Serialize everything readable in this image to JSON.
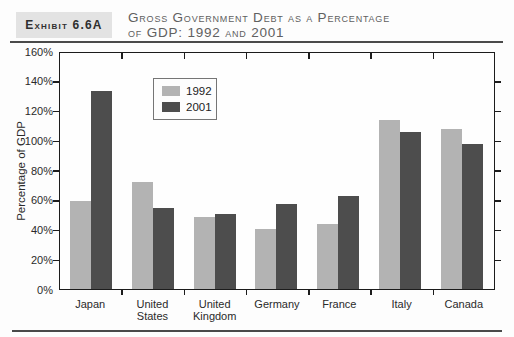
{
  "header": {
    "exhibit_label": "Exhibit 6.6A",
    "title_line1": "Gross Government Debt as a Percentage",
    "title_line2": "of GDP: 1992 and 2001"
  },
  "chart_data": {
    "type": "bar",
    "title": "Gross Government Debt as a Percentage of GDP: 1992 and 2001",
    "categories": [
      "Japan",
      "United States",
      "United Kingdom",
      "Germany",
      "France",
      "Italy",
      "Canada"
    ],
    "series": [
      {
        "name": "1992",
        "color": "#b3b3b3",
        "values": [
          60,
          73,
          49,
          41,
          44,
          115,
          109
        ]
      },
      {
        "name": "2001",
        "color": "#4d4d4d",
        "values": [
          135,
          55,
          51,
          58,
          63,
          107,
          99
        ]
      }
    ],
    "xlabel": "",
    "ylabel": "Percentage of GDP",
    "ylim": [
      0,
      160
    ],
    "ytick_step": 20,
    "yticks": [
      "0%",
      "20%",
      "40%",
      "60%",
      "80%",
      "100%",
      "120%",
      "140%",
      "160%"
    ],
    "grid": false,
    "legend_position": "inside-upper-left"
  },
  "colors": {
    "page_bg": "#fdfdfd",
    "exhibit_box_bg": "#e3e3e3",
    "exhibit_text": "#2f2f2f",
    "title_text": "#606060",
    "rule": "#4a4a4a",
    "plot_border": "#1c1c1c",
    "axis_text": "#2a2a2a",
    "legend_border": "#757575"
  }
}
